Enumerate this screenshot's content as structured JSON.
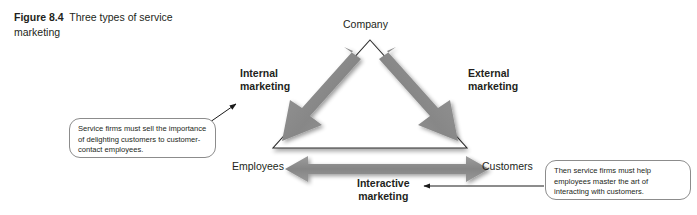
{
  "figure": {
    "number_label": "Figure 8.4",
    "caption_text": "Three types of service marketing"
  },
  "diagram": {
    "type": "services-marketing-triangle",
    "vertices": {
      "top": "Company",
      "bottom_left": "Employees",
      "bottom_right": "Customers"
    },
    "arrow_labels": {
      "left_line1": "Internal",
      "left_line2": "marketing",
      "right_line1": "External",
      "right_line2": "marketing",
      "bottom_line1": "Interactive",
      "bottom_line2": "marketing"
    },
    "callouts": {
      "left": "Service firms must sell the importance of delighting customers to customer-contact employees.",
      "right": "Then service firms must help employees master the art of interacting with customers."
    },
    "colors": {
      "arrow_gray": "#8a8a8a",
      "arrow_gray_dark": "#7a7a7a",
      "triangle_outline": "#2b2b2b",
      "text": "#231f20",
      "callout_border": "#8c8c8c",
      "pointer_line": "#1a1a1a",
      "background": "#ffffff"
    }
  }
}
